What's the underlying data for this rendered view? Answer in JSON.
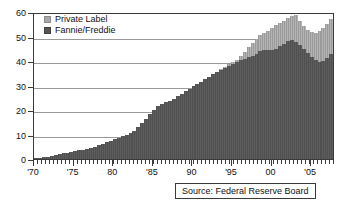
{
  "chart_data": {
    "type": "area",
    "title": "",
    "xlabel": "",
    "ylabel": "",
    "ylim": [
      0,
      60
    ],
    "xlim": [
      1970,
      2008
    ],
    "grid": true,
    "legend_position": "top-left",
    "y_ticks": [
      0,
      10,
      20,
      30,
      40,
      50,
      60
    ],
    "x_ticks": [
      "'70",
      "'75",
      "80",
      "'85",
      "90",
      "'95",
      "00",
      "'05"
    ],
    "x_tick_years": [
      1970,
      1975,
      1980,
      1985,
      1990,
      1995,
      2000,
      2005
    ],
    "x": [
      1970,
      1970.5,
      1971,
      1971.5,
      1972,
      1972.5,
      1973,
      1973.5,
      1974,
      1974.5,
      1975,
      1975.5,
      1976,
      1976.5,
      1977,
      1977.5,
      1978,
      1978.5,
      1979,
      1979.5,
      1980,
      1980.5,
      1981,
      1981.5,
      1982,
      1982.5,
      1983,
      1983.5,
      1984,
      1984.5,
      1985,
      1985.5,
      1986,
      1986.5,
      1987,
      1987.5,
      1988,
      1988.5,
      1989,
      1989.5,
      1990,
      1990.5,
      1991,
      1991.5,
      1992,
      1992.5,
      1993,
      1993.5,
      1994,
      1994.5,
      1995,
      1995.5,
      1996,
      1996.5,
      1997,
      1997.5,
      1998,
      1998.5,
      1999,
      1999.5,
      2000,
      2000.5,
      2001,
      2001.5,
      2002,
      2002.5,
      2003,
      2003.5,
      2004,
      2004.5,
      2005,
      2005.5,
      2006,
      2006.5,
      2007,
      2007.5
    ],
    "series": [
      {
        "name": "Fannie/Freddie",
        "color": "#565656",
        "values": [
          0.4,
          0.6,
          0.8,
          1.0,
          1.3,
          1.6,
          2.0,
          2.3,
          2.6,
          2.9,
          3.2,
          3.5,
          3.8,
          4.1,
          4.5,
          5.0,
          5.6,
          6.2,
          6.8,
          7.4,
          8.0,
          8.6,
          9.2,
          9.8,
          10.6,
          11.6,
          13.0,
          14.6,
          16.4,
          18.2,
          20.2,
          21.6,
          22.6,
          23.2,
          23.8,
          24.6,
          25.6,
          26.6,
          27.6,
          28.6,
          29.6,
          30.6,
          31.6,
          32.6,
          33.6,
          34.6,
          35.6,
          36.4,
          37.2,
          38.0,
          38.8,
          39.6,
          40.4,
          41.0,
          41.6,
          42.2,
          43.0,
          44.0,
          44.6,
          44.6,
          44.4,
          45.0,
          46.0,
          47.0,
          48.0,
          48.6,
          47.8,
          46.4,
          44.8,
          43.2,
          41.6,
          40.4,
          39.8,
          40.2,
          41.4,
          43.0
        ]
      },
      {
        "name": "Private Label",
        "color": "#a8a8a8",
        "values": [
          0,
          0,
          0,
          0,
          0,
          0,
          0,
          0,
          0,
          0,
          0,
          0,
          0,
          0,
          0,
          0,
          0,
          0,
          0,
          0,
          0,
          0,
          0,
          0,
          0,
          0,
          0,
          0,
          0,
          0,
          0,
          0,
          0,
          0,
          0,
          0,
          0,
          0,
          0,
          0,
          0,
          0,
          0,
          0,
          0,
          0,
          0,
          0.2,
          0.4,
          0.6,
          0.8,
          1.0,
          1.6,
          2.8,
          4.0,
          5.0,
          6.0,
          6.6,
          7.0,
          7.8,
          9.0,
          9.6,
          9.6,
          9.4,
          9.4,
          9.8,
          11.0,
          10.0,
          9.4,
          9.6,
          10.2,
          11.0,
          12.6,
          13.4,
          13.8,
          14.0
        ]
      }
    ],
    "annotations": [
      {
        "name": "source",
        "text": "Source:  Federal Reserve Board"
      }
    ]
  },
  "legend": {
    "items": [
      {
        "label": "Private Label",
        "key": "private"
      },
      {
        "label": "Fannie/Freddie",
        "key": "fannie"
      }
    ]
  },
  "source": {
    "text": "Source:  Federal Reserve Board"
  }
}
